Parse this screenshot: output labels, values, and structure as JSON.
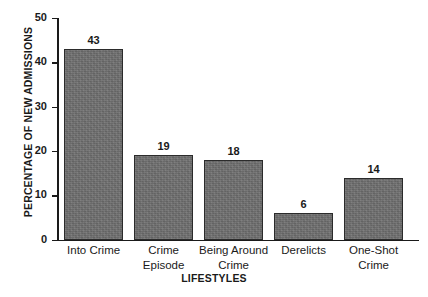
{
  "chart_data": {
    "type": "bar",
    "title": "",
    "subtitle": "",
    "xlabel": "LIFESTYLES",
    "ylabel": "PERCENTAGE OF NEW ADMISSIONS",
    "categories": [
      "Into Crime",
      "Crime\nEpisode",
      "Being Around\nCrime",
      "Derelicts",
      "One-Shot\nCrime"
    ],
    "category_lines": [
      [
        "Into Crime"
      ],
      [
        "Crime",
        "Episode"
      ],
      [
        "Being Around",
        "Crime"
      ],
      [
        "Derelicts"
      ],
      [
        "One-Shot",
        "Crime"
      ]
    ],
    "values": [
      43,
      19,
      18,
      6,
      14
    ],
    "data_labels": [
      "43",
      "19",
      "18",
      "6",
      "14"
    ],
    "ylim": [
      0,
      50
    ],
    "ytick_values": [
      0,
      10,
      20,
      30,
      40,
      50
    ],
    "ytick_labels": [
      "0",
      "10",
      "20",
      "30",
      "40",
      "50"
    ],
    "grid": false,
    "legend": false,
    "legend_position": "none",
    "bar_fill_color": "#6e6e6e",
    "bar_edge_color": "#2b2b2b",
    "axis_color": "#1a1a1a",
    "background_color": "#ffffff"
  }
}
